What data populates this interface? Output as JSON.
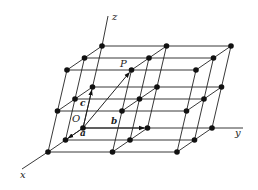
{
  "diagram": {
    "title": "",
    "type": "crystal-lattice-3x3x3",
    "colors": {
      "line": "#222222",
      "node": "#111111",
      "background": "#ffffff"
    },
    "origin_px": [
      83,
      128
    ],
    "basis_px": {
      "a": [
        -17.5,
        12
      ],
      "b": [
        64.5,
        0
      ],
      "c": [
        9.5,
        -41
      ]
    },
    "grid_size": [
      3,
      3,
      3
    ],
    "axes": {
      "x": {
        "label": "x",
        "from": [
          47.75,
          152
        ],
        "to": [
          22,
          169
        ],
        "label_pos": [
          20,
          178
        ]
      },
      "y": {
        "label": "y",
        "from": [
          212,
          128
        ],
        "to": [
          243,
          128
        ],
        "label_pos": [
          235,
          136
        ]
      },
      "z": {
        "label": "z",
        "from": [
          102,
          46
        ],
        "to": [
          108,
          16
        ],
        "label_pos": [
          112,
          20
        ]
      }
    },
    "vectors": [
      {
        "name": "a",
        "label": "a",
        "to_index": [
          1,
          0,
          0
        ],
        "label_pos": [
          80,
          136
        ]
      },
      {
        "name": "b",
        "label": "b",
        "to_index": [
          0,
          1,
          0
        ],
        "label_pos": [
          111,
          124
        ]
      },
      {
        "name": "c",
        "label": "c",
        "to_index": [
          0,
          0,
          1
        ],
        "label_pos": [
          80,
          106
        ]
      },
      {
        "name": "OP",
        "label": "",
        "to_index": [
          2,
          1,
          2
        ],
        "label_pos": [
          0,
          0
        ]
      }
    ],
    "points": [
      {
        "label": "O",
        "index": [
          0,
          0,
          0
        ],
        "label_pos": [
          72,
          122
        ]
      },
      {
        "label": "P",
        "index": [
          2,
          1,
          2
        ],
        "label_pos": [
          120,
          67
        ]
      }
    ]
  }
}
